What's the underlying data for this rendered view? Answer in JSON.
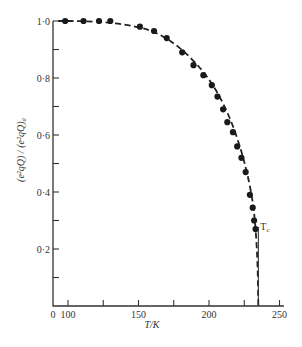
{
  "chart_data": {
    "type": "scatter",
    "title": "",
    "xlabel": "T/K",
    "ylabel": "(e²qQ) / (e²qQ)₀",
    "xlim": [
      89,
      250
    ],
    "ylim": [
      0,
      1.0
    ],
    "x_axis_origin_label": "0",
    "x_ticks": [
      100,
      125,
      150,
      175,
      200,
      225,
      250
    ],
    "x_tick_labels": [
      "100",
      "",
      "150",
      "",
      "200",
      "",
      "250"
    ],
    "y_ticks": [
      0.1,
      0.2,
      0.3,
      0.4,
      0.5,
      0.6,
      0.7,
      0.8,
      0.9,
      1.0
    ],
    "y_tick_labels": [
      "",
      "0·2",
      "",
      "0·4",
      "",
      "0·6",
      "",
      "0·8",
      "",
      "1·0"
    ],
    "grid": false,
    "legend": null,
    "series": [
      {
        "name": "measured",
        "style": "filled-circle",
        "x": [
          98,
          111,
          122,
          130,
          151,
          161,
          170,
          181,
          189,
          196,
          202,
          206,
          210,
          213,
          217,
          220,
          223,
          226,
          229,
          231,
          232,
          233
        ],
        "y": [
          1.0,
          1.0,
          1.0,
          1.0,
          0.98,
          0.965,
          0.94,
          0.89,
          0.845,
          0.81,
          0.775,
          0.735,
          0.69,
          0.645,
          0.61,
          0.56,
          0.52,
          0.47,
          0.39,
          0.345,
          0.3,
          0.27
        ]
      },
      {
        "name": "theory fit",
        "style": "dashed-line",
        "x": [
          93,
          110,
          130,
          150,
          165,
          180,
          195,
          205,
          215,
          222,
          227,
          231,
          233,
          234.5,
          235
        ],
        "y": [
          1.0,
          1.0,
          0.995,
          0.98,
          0.955,
          0.905,
          0.83,
          0.76,
          0.66,
          0.56,
          0.47,
          0.37,
          0.28,
          0.15,
          0.0
        ]
      }
    ],
    "annotations": [
      {
        "text": "T",
        "subscript": "c",
        "x": 235,
        "y": 0.27,
        "note": "vertical line at Tc ≈ 235 K down to axis"
      }
    ],
    "tc": 235
  }
}
